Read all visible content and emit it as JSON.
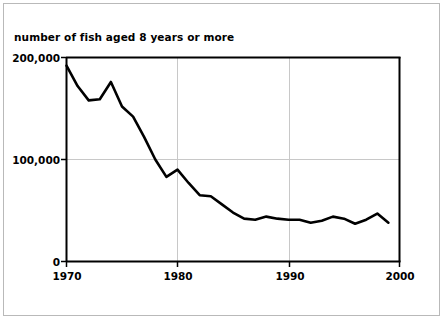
{
  "chart_data": {
    "type": "line",
    "title": "number of fish aged 8 years or more",
    "xlabel": "",
    "ylabel": "",
    "xlim": [
      1970,
      2000
    ],
    "ylim": [
      0,
      200000
    ],
    "grid": true,
    "legend": null,
    "x_ticks": [
      "1970",
      "1980",
      "1990",
      "2000"
    ],
    "x_tick_values": [
      1970,
      1980,
      1990,
      2000
    ],
    "y_ticks": [
      "0",
      "100,000",
      "200,000"
    ],
    "y_tick_values": [
      0,
      100000,
      200000
    ],
    "series": [
      {
        "name": "number of fish aged 8 years or more",
        "color": "#000000",
        "x": [
          1970,
          1971,
          1972,
          1973,
          1974,
          1975,
          1976,
          1977,
          1978,
          1979,
          1980,
          1981,
          1982,
          1983,
          1984,
          1985,
          1986,
          1987,
          1988,
          1989,
          1990,
          1991,
          1992,
          1993,
          1994,
          1995,
          1996,
          1997,
          1998,
          1999
        ],
        "values": [
          192000,
          172000,
          158000,
          159000,
          176000,
          152000,
          142000,
          122000,
          100000,
          83000,
          90000,
          77000,
          65000,
          64000,
          56000,
          48000,
          42000,
          41000,
          44000,
          42000,
          41000,
          41000,
          38000,
          40000,
          44000,
          42000,
          37000,
          41000,
          47000,
          38000
        ]
      }
    ]
  },
  "axes": {
    "y_labels": [
      {
        "text": "200,000"
      },
      {
        "text": "100,000"
      },
      {
        "text": "0"
      }
    ],
    "x_labels": [
      {
        "text": "1970"
      },
      {
        "text": "1980"
      },
      {
        "text": "1990"
      },
      {
        "text": "2000"
      }
    ]
  },
  "colors": {
    "line": "#000000",
    "axis": "#000000",
    "grid": "#c8c8c8",
    "frame": "#b9b9b9",
    "background": "#ffffff"
  }
}
